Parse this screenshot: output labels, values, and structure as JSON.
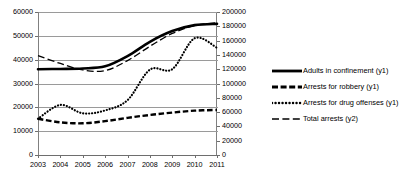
{
  "chart_data": {
    "type": "line",
    "title": "",
    "xlabel": "",
    "ylabel": "",
    "grid": true,
    "legend_position": "right",
    "categories": [
      "2003",
      "2004",
      "2005",
      "2006",
      "2007",
      "2008",
      "2009",
      "2010",
      "2011"
    ],
    "x": [
      2003,
      2004,
      2005,
      2006,
      2007,
      2008,
      2009,
      2010,
      2011
    ],
    "axes": {
      "y1": {
        "label": "",
        "ylim": [
          0,
          60000
        ],
        "ticks": [
          0,
          10000,
          20000,
          30000,
          40000,
          50000,
          60000
        ],
        "tick_labels": [
          "0",
          "10000",
          "20000",
          "30000",
          "40000",
          "50000",
          "60000"
        ],
        "position": "left"
      },
      "y2": {
        "label": "",
        "ylim": [
          0,
          200000
        ],
        "ticks": [
          0,
          20000,
          40000,
          60000,
          80000,
          100000,
          120000,
          140000,
          160000,
          180000,
          200000
        ],
        "tick_labels": [
          "0",
          "20000",
          "40000",
          "60000",
          "80000",
          "100000",
          "120000",
          "140000",
          "160000",
          "180000",
          "200000"
        ],
        "position": "right"
      },
      "x": {
        "ticks": [
          2003,
          2004,
          2005,
          2006,
          2007,
          2008,
          2009,
          2010,
          2011
        ],
        "tick_labels": [
          "2003",
          "2004",
          "2005",
          "2006",
          "2007",
          "2008",
          "2009",
          "2010",
          "2011"
        ]
      }
    },
    "series": [
      {
        "name": "Adults in confinement (y1)",
        "axis": "y1",
        "style": "solid-thick",
        "color": "#000000",
        "values": [
          36000,
          36100,
          36300,
          37200,
          41500,
          47500,
          52000,
          54500,
          55000
        ]
      },
      {
        "name": "Arrests for robbery (y1)",
        "axis": "y1",
        "style": "dashed-thick",
        "color": "#000000",
        "values": [
          15200,
          13700,
          13300,
          14200,
          15600,
          16800,
          17800,
          18600,
          18900
        ]
      },
      {
        "name": "Arrests for drug offenses (y1)",
        "axis": "y1",
        "style": "dotted",
        "color": "#000000",
        "values": [
          15200,
          21000,
          17500,
          18700,
          23000,
          35800,
          36000,
          49000,
          45000
        ]
      },
      {
        "name": "Total arrests (y2)",
        "axis": "y2",
        "style": "dashed-long",
        "color": "#000000",
        "values": [
          139000,
          128000,
          119000,
          118000,
          132000,
          152000,
          170000,
          181000,
          185000
        ]
      }
    ]
  },
  "legend": {
    "items": [
      {
        "label": "Adults in confinement (y1)",
        "swatch": "solid-thick-swatch"
      },
      {
        "label": "Arrests for robbery (y1)",
        "swatch": "dashed-thick-swatch"
      },
      {
        "label": "Arrests for drug offenses (y1)",
        "swatch": "dotted-swatch"
      },
      {
        "label": "Total arrests (y2)",
        "swatch": "dashed-long-swatch"
      }
    ]
  }
}
